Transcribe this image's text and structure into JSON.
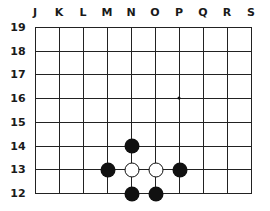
{
  "board": {
    "columns": [
      "J",
      "K",
      "L",
      "M",
      "N",
      "O",
      "P",
      "Q",
      "R",
      "S"
    ],
    "rows": [
      "19",
      "18",
      "17",
      "16",
      "15",
      "14",
      "13",
      "12"
    ],
    "line_color": "#222222",
    "stones": [
      {
        "color": "black",
        "point": "N14"
      },
      {
        "color": "black",
        "point": "M13"
      },
      {
        "color": "white",
        "point": "N13"
      },
      {
        "color": "white",
        "point": "O13"
      },
      {
        "color": "black",
        "point": "P13"
      },
      {
        "color": "black",
        "point": "N12"
      },
      {
        "color": "black",
        "point": "O12"
      }
    ],
    "star_points": [
      "P16"
    ]
  }
}
